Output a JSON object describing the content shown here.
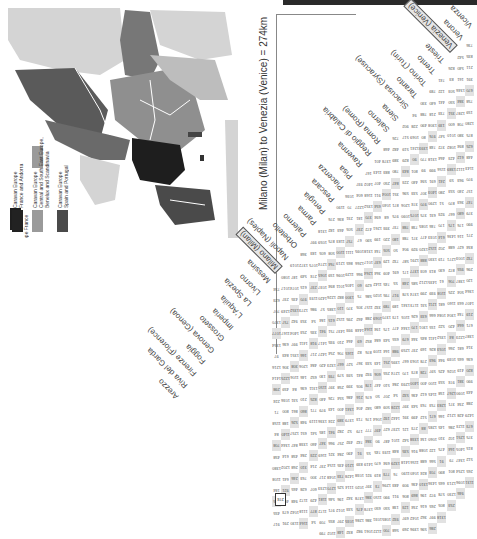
{
  "header": {
    "title": "Milano (Milan) to Venezia (Venice) = 274km",
    "highlight_value": "274"
  },
  "map": {
    "legend": [
      {
        "line1": "Caravan Europe",
        "line2": "France and Andorra",
        "color": "#222222"
      },
      {
        "line1": "Caravan Europe",
        "line2": "Central and South East Europe, Benelux and Scandinavia",
        "color": "#9a9a9a"
      },
      {
        "line1": "Caravan Europe",
        "line2": "Spain and Portugal",
        "color": "#4a4a4a"
      }
    ],
    "colors": {
      "sea": "#ffffff",
      "other_land": "#d0d0d0",
      "france": "#1e1e1e",
      "spain_portugal": "#4a4a4a",
      "central": "#8f8f8f",
      "borders": "#ffffff"
    }
  },
  "table": {
    "cities": [
      "Vicenza",
      "Verona",
      "Venezia (Venice)",
      "Trieste",
      "Trento",
      "Torino (Turin)",
      "Taranto",
      "Siracusa (Syracuse)",
      "Siena",
      "Salerno",
      "Roma (Rome)",
      "Reggio di Calabria",
      "Ravenna",
      "Pisa",
      "Piacenza",
      "Pescara",
      "Perugia",
      "Parma",
      "Palermo",
      "Orbetello",
      "Napoli (Naples)",
      "Milano (Milan)",
      "Messina",
      "Livorno",
      "La Spezia",
      "L'Aquila",
      "Imperia",
      "Grosseto",
      "Genova (Genoa)",
      "Foggia",
      "Firenze (Florence)",
      "Riva del Garda",
      "Arezzo"
    ],
    "boxed_cities": [
      "Venezia (Venice)",
      "Milano (Milan)"
    ],
    "sample_values": {
      "Vicenza-Verona": "52",
      "Verona-Venezia": "115",
      "Vicenza-Venezia": "73",
      "Milano-Venezia": "274",
      "Milano-Messina": "1272",
      "Trieste-Venezia": "159",
      "Trento-Venezia": "253",
      "Torino-Trieste": "540",
      "Taranto-Siracusa": "1088",
      "Siena-Siracusa": "344",
      "Napoli-Milano": "788",
      "Orbetello-Napoli": "1089",
      "Palermo-Orbetello": "1137",
      "Pisa-Ravenna": "235",
      "Piacenza-Pisa": "214"
    }
  }
}
